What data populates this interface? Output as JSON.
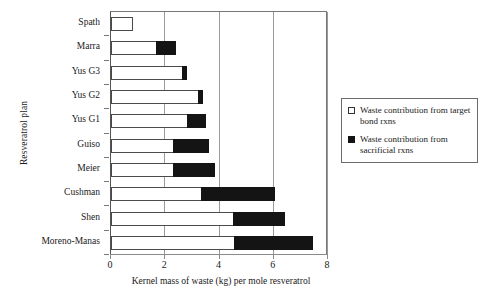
{
  "chart_data": {
    "type": "bar",
    "orientation": "horizontal",
    "stacked": true,
    "title": "",
    "xlabel": "Kernel mass of waste (kg) per mole resveratrol",
    "ylabel": "Resveratrol plan",
    "xlim": [
      0,
      8
    ],
    "ylim": null,
    "xticks": [
      0,
      2,
      4,
      6,
      8
    ],
    "xtick_labels": [
      "0",
      "2",
      "4",
      "6",
      "8"
    ],
    "grid": "vertical",
    "legend_position": "right",
    "categories": [
      "Spath",
      "Marra",
      "Yus G3",
      "Yus G2",
      "Yus G1",
      "Guiso",
      "Meier",
      "Cushman",
      "Shen",
      "Moreno-Manas"
    ],
    "series": [
      {
        "name": "Waste contribution from target bond rxns",
        "color": "#ffffff",
        "edge_color": "#4a4a4a",
        "values": [
          0.8,
          1.65,
          2.6,
          3.2,
          2.8,
          2.3,
          2.3,
          3.3,
          4.5,
          4.55
        ]
      },
      {
        "name": "Waste contribution from sacrificial rxns",
        "color": "#141414",
        "edge_color": "#141414",
        "values": [
          0.0,
          0.75,
          0.2,
          0.2,
          0.7,
          1.3,
          1.55,
          2.75,
          1.9,
          2.9
        ]
      }
    ],
    "totals": [
      0.8,
      2.4,
      2.8,
      3.4,
      3.5,
      3.6,
      3.85,
      6.05,
      6.4,
      7.45
    ]
  },
  "legend": {
    "items": [
      {
        "marker": "open-square-swatch",
        "label": "Waste contribution from target bond rxns"
      },
      {
        "marker": "filled-square-swatch",
        "label": "Waste contribution from sacrificial rxns"
      }
    ]
  },
  "axes": {
    "x_title": "Kernel mass of waste (kg) per mole resveratrol",
    "y_title": "Resveratrol plan",
    "x_tick_0": "0",
    "x_tick_1": "2",
    "x_tick_2": "4",
    "x_tick_3": "6",
    "x_tick_4": "8"
  },
  "colors": {
    "target_bond": "#ffffff",
    "sacrificial": "#141414",
    "axis": "#8a8a8a",
    "grid": "#9a9a9a",
    "text": "#1a1a1a"
  }
}
